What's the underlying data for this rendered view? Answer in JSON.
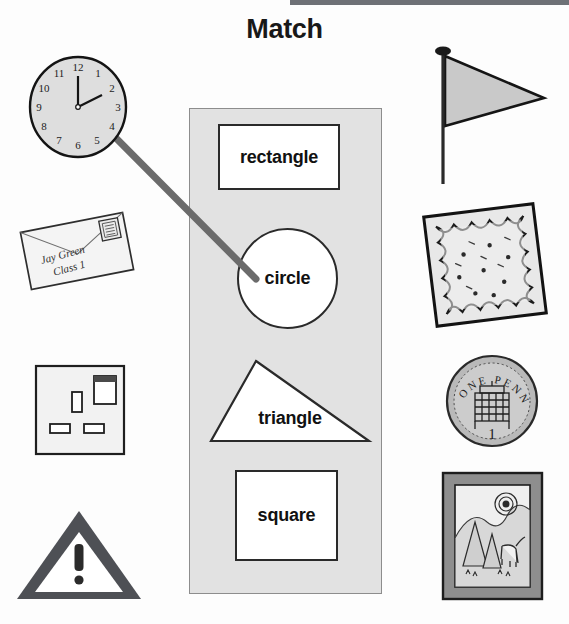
{
  "page": {
    "title": "Match",
    "background_color": "#fdfdfd",
    "width": 569,
    "height": 624
  },
  "top_bar": {
    "color": "#6e7176"
  },
  "center_panel": {
    "background_color": "#e2e2e2",
    "border_color": "#8d8d8d",
    "shapes": [
      {
        "name": "rectangle",
        "label": "rectangle",
        "type": "rectangle"
      },
      {
        "name": "circle",
        "label": "circle",
        "type": "circle"
      },
      {
        "name": "triangle",
        "label": "triangle",
        "type": "triangle"
      },
      {
        "name": "square",
        "label": "square",
        "type": "square"
      }
    ]
  },
  "connector": {
    "label": "match-line-clock-to-circle",
    "color": "#6b6b6b",
    "from": "clock",
    "to": "circle",
    "x1": 101,
    "y1": 123,
    "x2": 256,
    "y2": 279
  },
  "objects_left": [
    {
      "name": "clock",
      "description": "analogue wall clock",
      "numerals": [
        "12",
        "1",
        "2",
        "3",
        "4",
        "5",
        "6",
        "7",
        "8",
        "9",
        "10",
        "11"
      ],
      "matched_shape": "circle"
    },
    {
      "name": "envelope",
      "description": "addressed envelope with stamp",
      "address_line_1": "Jay Green",
      "address_line_2": "Class 1",
      "matched_shape": "rectangle"
    },
    {
      "name": "socket",
      "description": "electrical wall socket",
      "matched_shape": "square"
    },
    {
      "name": "warning-sign",
      "description": "warning triangle with exclamation mark",
      "symbol": "!",
      "matched_shape": "triangle"
    }
  ],
  "objects_right": [
    {
      "name": "flag",
      "description": "triangular pennant flag on a pole",
      "matched_shape": "triangle"
    },
    {
      "name": "cloth",
      "description": "square handkerchief with scalloped edge",
      "matched_shape": "square"
    },
    {
      "name": "coin",
      "description": "one penny coin",
      "text_top": "ONE PENNY",
      "value": "1",
      "matched_shape": "circle"
    },
    {
      "name": "picture-frame",
      "description": "framed landscape picture with sun, mountains, trees and a cow",
      "matched_shape": "rectangle"
    }
  ]
}
